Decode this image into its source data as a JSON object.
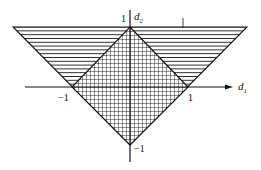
{
  "diagram": {
    "type": "region-plot",
    "axes": {
      "x": {
        "label": "d",
        "subscript": "1"
      },
      "y": {
        "label": "d",
        "subscript": "2"
      }
    },
    "tick_labels": {
      "x_neg": "−1",
      "x_pos": "1",
      "y_pos": "1",
      "y_neg": "−1"
    },
    "regions": [
      {
        "name": "triangle",
        "fill": "horizontal-hatch"
      },
      {
        "name": "diamond",
        "fill": "cross-hatch"
      }
    ],
    "colors": {
      "ink": "#111111",
      "background": "#ffffff"
    }
  }
}
